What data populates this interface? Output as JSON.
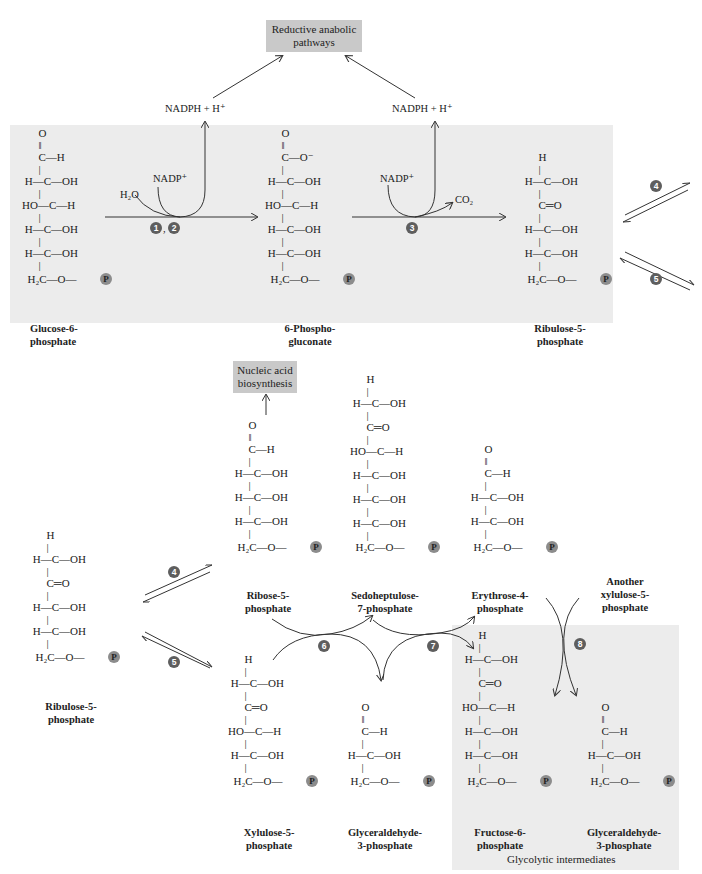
{
  "boxes": {
    "reductive": "Reductive anabolic pathways",
    "nucleic": "Nucleic acid biosynthesis",
    "glycolytic_label": "Glycolytic intermediates"
  },
  "cofactors": {
    "nadph_left": "NADPH  +  H⁺",
    "nadph_right": "NADPH  +  H⁺",
    "nadp_1": "NADP⁺",
    "nadp_2": "NADP⁺",
    "h2o": "H₂O",
    "co2": "CO₂"
  },
  "steps": {
    "s1": "1",
    "s2": "2",
    "s3": "3",
    "s4a": "4",
    "s5a": "5",
    "s4b": "4",
    "s5b": "5",
    "s6": "6",
    "s7": "7",
    "s8": "8",
    "comma": ","
  },
  "phosphate_symbol": "P",
  "molecules": {
    "glucose6p": {
      "name": "Glucose-6-\nphosphate",
      "rows": [
        "      O",
        "      ‖",
        "      C—H",
        "      |",
        " H—C—OH",
        "      |",
        "HO—C—H",
        "      |",
        " H—C—OH",
        "      |",
        " H—C—OH",
        "      |",
        "  H₂C—O—"
      ]
    },
    "phosphogluconate": {
      "name": "6-Phospho-\ngluconate",
      "rows": [
        "      O",
        "      ‖",
        "      C—O⁻",
        "      |",
        " H—C—OH",
        "      |",
        "HO—C—H",
        "      |",
        " H—C—OH",
        "      |",
        " H—C—OH",
        "      |",
        "  H₂C—O—"
      ]
    },
    "ribulose5p_top": {
      "name": "Ribulose-5-\nphosphate",
      "rows": [
        "      H",
        "      |",
        " H—C—OH",
        "      |",
        "      C═O",
        "      |",
        " H—C—OH",
        "      |",
        " H—C—OH",
        "      |",
        "  H₂C—O—"
      ]
    },
    "ribulose5p_bottom": {
      "name": "Ribulose-5-\nphosphate",
      "rows": [
        "      H",
        "      |",
        " H—C—OH",
        "      |",
        "      C═O",
        "      |",
        " H—C—OH",
        "      |",
        " H—C—OH",
        "      |",
        "  H₂C—O—"
      ]
    },
    "ribose5p": {
      "name": "Ribose-5-\nphosphate",
      "rows": [
        "      O",
        "      ‖",
        "      C—H",
        "      |",
        " H—C—OH",
        "      |",
        " H—C—OH",
        "      |",
        " H—C—OH",
        "      |",
        "  H₂C—O—"
      ]
    },
    "sedoheptulose7p": {
      "name": "Sedoheptulose-\n7-phosphate",
      "rows": [
        "      H",
        "      |",
        " H—C—OH",
        "      |",
        "      C═O",
        "      |",
        "HO—C—H",
        "      |",
        " H—C—OH",
        "      |",
        " H—C—OH",
        "      |",
        " H—C—OH",
        "      |",
        "  H₂C—O—"
      ]
    },
    "erythrose4p": {
      "name": "Erythrose-4-\nphosphate",
      "rows": [
        "      O",
        "      ‖",
        "      C—H",
        "      |",
        " H—C—OH",
        "      |",
        " H—C—OH",
        "      |",
        "  H₂C—O—"
      ]
    },
    "another_xylulose5p": {
      "name": "Another\nxylulose-5-\nphosphate"
    },
    "xylulose5p": {
      "name": "Xylulose-5-\nphosphate",
      "rows": [
        "      H",
        "      |",
        " H—C—OH",
        "      |",
        "      C═O",
        "      |",
        "HO—C—H",
        "      |",
        " H—C—OH",
        "      |",
        "  H₂C—O—"
      ]
    },
    "glyceraldehyde3p_mid": {
      "name": "Glyceraldehyde-\n3-phosphate",
      "rows": [
        "      O",
        "      ‖",
        "      C—H",
        "      |",
        " H—C—OH",
        "      |",
        "  H₂C—O—"
      ]
    },
    "fructose6p": {
      "name": "Fructose-6-\nphosphate",
      "rows": [
        "      H",
        "      |",
        " H—C—OH",
        "      |",
        "      C═O",
        "      |",
        "HO—C—H",
        "      |",
        " H—C—OH",
        "      |",
        " H—C—OH",
        "      |",
        "  H₂C—O—"
      ]
    },
    "glyceraldehyde3p_right": {
      "name": "Glyceraldehyde-\n3-phosphate",
      "rows": [
        "      O",
        "      ‖",
        "      C—H",
        "      |",
        " H—C—OH",
        "      |",
        "  H₂C—O—"
      ]
    }
  },
  "colors": {
    "panel": "#ececec",
    "box": "#c9c9c9",
    "step_circle": "#5e5e5e",
    "phosphate_circle": "#8c8c8c"
  }
}
